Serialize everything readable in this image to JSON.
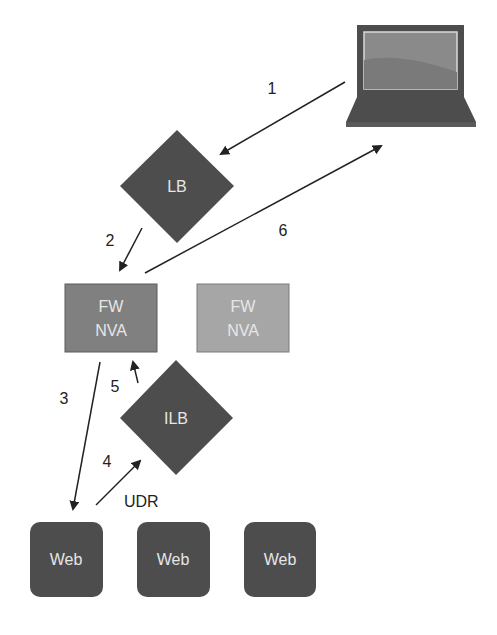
{
  "diagram": {
    "colors": {
      "dark_node": "#4d4d4d",
      "fw_active": "#808080",
      "fw_standby": "#a6a6a6",
      "arrow": "#222222",
      "node_text": "#e6e6e6"
    },
    "nodes": {
      "client": {
        "type": "laptop-icon"
      },
      "lb": {
        "label": "LB"
      },
      "fw1": {
        "line1": "FW",
        "line2": "NVA"
      },
      "fw2": {
        "line1": "FW",
        "line2": "NVA"
      },
      "ilb": {
        "label": "ILB"
      },
      "web": [
        {
          "label": "Web"
        },
        {
          "label": "Web"
        },
        {
          "label": "Web"
        }
      ]
    },
    "edges": [
      {
        "step": "1",
        "from": "client",
        "to": "lb"
      },
      {
        "step": "2",
        "from": "lb",
        "to": "fw1"
      },
      {
        "step": "3",
        "from": "fw1",
        "to": "web1"
      },
      {
        "step": "4",
        "from": "web1",
        "to": "ilb"
      },
      {
        "step": "5",
        "from": "ilb",
        "to": "fw1"
      },
      {
        "step": "6",
        "from": "fw1",
        "to": "client"
      }
    ],
    "annotations": {
      "udr": "UDR"
    }
  }
}
